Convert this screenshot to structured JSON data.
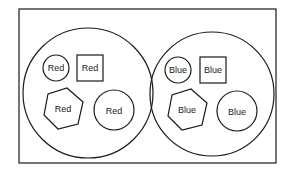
{
  "diagram": {
    "frame": {
      "x": 19,
      "y": 9,
      "width": 257,
      "height": 154
    },
    "groups": [
      {
        "name": "red-set",
        "container": {
          "cx": 88,
          "cy": 93,
          "r": 65
        },
        "items": [
          {
            "shape": "circle",
            "label": "Red",
            "cx": 56,
            "cy": 68,
            "r": 13
          },
          {
            "shape": "square",
            "label": "Red",
            "x": 77,
            "y": 55,
            "w": 26,
            "h": 26
          },
          {
            "shape": "hexagon",
            "label": "Red",
            "cx": 63,
            "cy": 108,
            "r": 21
          },
          {
            "shape": "circle",
            "label": "Red",
            "cx": 114,
            "cy": 110,
            "r": 20
          }
        ]
      },
      {
        "name": "blue-set",
        "container": {
          "cx": 212,
          "cy": 94,
          "r": 62
        },
        "items": [
          {
            "shape": "circle",
            "label": "Blue",
            "cx": 178,
            "cy": 70,
            "r": 13
          },
          {
            "shape": "square",
            "label": "Blue",
            "x": 200,
            "y": 57,
            "w": 26,
            "h": 26
          },
          {
            "shape": "hexagon",
            "label": "Blue",
            "cx": 187,
            "cy": 110,
            "r": 21
          },
          {
            "shape": "circle",
            "label": "Blue",
            "cx": 237,
            "cy": 111,
            "r": 20
          }
        ]
      }
    ],
    "labels": {
      "red_circle_small": "Red",
      "red_square": "Red",
      "red_hexagon": "Red",
      "red_circle_large": "Red",
      "blue_circle_small": "Blue",
      "blue_square": "Blue",
      "blue_hexagon": "Blue",
      "blue_circle_large": "Blue"
    }
  }
}
